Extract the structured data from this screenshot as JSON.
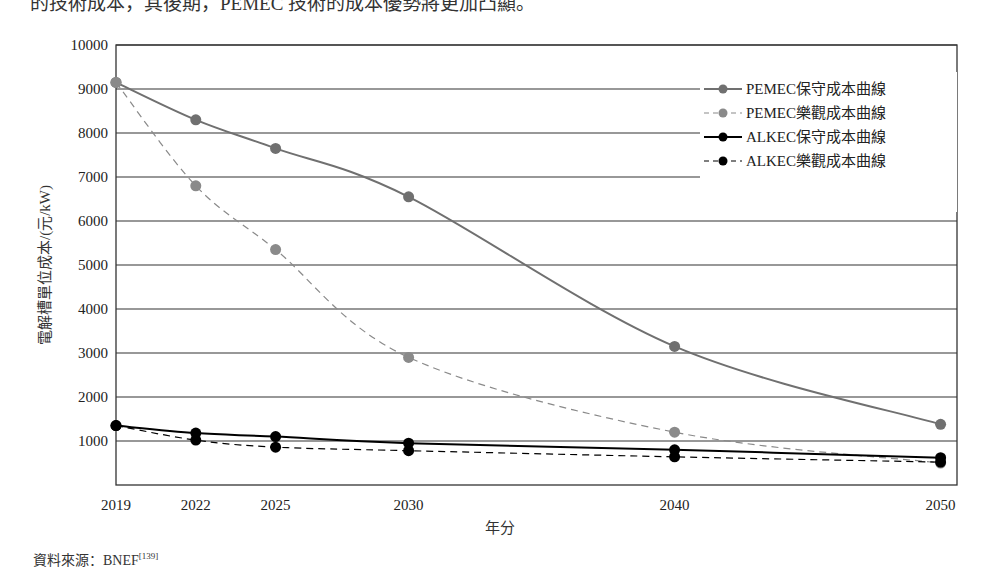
{
  "page": {
    "top_text": "的技術成本，其後期，PEMEC 技術的成本優勢將更加凸顯。",
    "source_label": "資料來源：BNEF",
    "source_ref": "[139]"
  },
  "chart_data": {
    "type": "line",
    "title": "",
    "xlabel": "年分",
    "ylabel": "電解槽單位成本/(元/kW)",
    "x": [
      2019,
      2022,
      2025,
      2030,
      2040,
      2050
    ],
    "x_tick_labels": [
      "2019",
      "2022",
      "2025",
      "2030",
      "2040",
      "2050"
    ],
    "y_tick_labels": [
      "1000",
      "2000",
      "3000",
      "4000",
      "5000",
      "6000",
      "7000",
      "8000",
      "9000",
      "10000"
    ],
    "ylim": [
      0,
      10000
    ],
    "grid": true,
    "legend_position": "upper right",
    "series": [
      {
        "name": "PEMEC保守成本曲線",
        "values": [
          9150,
          8300,
          7650,
          6550,
          3150,
          1380
        ],
        "color": "#707070",
        "style": "solid"
      },
      {
        "name": "PEMEC樂觀成本曲線",
        "values": [
          9150,
          6800,
          5350,
          2900,
          1200,
          500
        ],
        "color": "#8a8a8a",
        "style": "dashed"
      },
      {
        "name": "ALKEC保守成本曲線",
        "values": [
          1350,
          1180,
          1100,
          950,
          800,
          620
        ],
        "color": "#000000",
        "style": "solid"
      },
      {
        "name": "ALKEC樂觀成本曲線",
        "values": [
          1350,
          1020,
          860,
          780,
          640,
          520
        ],
        "color": "#000000",
        "style": "dashed"
      }
    ]
  }
}
